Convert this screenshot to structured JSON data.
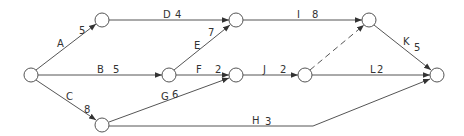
{
  "diagram": {
    "type": "activity-on-arrow network",
    "colors": {
      "line": "#444444",
      "node_fill": "#ffffff",
      "text": "#333333",
      "background": "#ffffff"
    },
    "nodes": [
      {
        "id": "n1",
        "x": 31,
        "y": 75
      },
      {
        "id": "n2",
        "x": 102,
        "y": 20
      },
      {
        "id": "n3",
        "x": 236,
        "y": 20
      },
      {
        "id": "n4",
        "x": 169,
        "y": 75
      },
      {
        "id": "n5",
        "x": 236,
        "y": 75
      },
      {
        "id": "n6",
        "x": 305,
        "y": 75
      },
      {
        "id": "n7",
        "x": 102,
        "y": 125
      },
      {
        "id": "n8",
        "x": 369,
        "y": 20
      },
      {
        "id": "n9",
        "x": 437,
        "y": 75
      }
    ],
    "activities": [
      {
        "name": "A",
        "duration": "5",
        "from": "n1",
        "to": "n2"
      },
      {
        "name": "B",
        "duration": "5",
        "from": "n1",
        "to": "n4"
      },
      {
        "name": "C",
        "duration": "8",
        "from": "n1",
        "to": "n7"
      },
      {
        "name": "D",
        "duration": "4",
        "from": "n2",
        "to": "n3"
      },
      {
        "name": "E",
        "duration": "7",
        "from": "n4",
        "to": "n3"
      },
      {
        "name": "F",
        "duration": "2",
        "from": "n4",
        "to": "n5"
      },
      {
        "name": "G",
        "duration": "6",
        "from": "n7",
        "to": "n5"
      },
      {
        "name": "H",
        "duration": "3",
        "from": "n7",
        "to": "n9"
      },
      {
        "name": "I",
        "duration": "8",
        "from": "n3",
        "to": "n8"
      },
      {
        "name": "J",
        "duration": "2",
        "from": "n5",
        "to": "n6"
      },
      {
        "name": "K",
        "duration": "5",
        "from": "n8",
        "to": "n9"
      },
      {
        "name": "L",
        "duration": "2",
        "from": "n6",
        "to": "n9"
      }
    ],
    "dummies": [
      {
        "from": "n6",
        "to": "n8",
        "style": "dashed"
      }
    ],
    "labels": {
      "A": "A",
      "A_dur": "5",
      "B": "B",
      "B_dur": "5",
      "C": "C",
      "C_dur": "8",
      "D": "D",
      "D_dur": "4",
      "E": "E",
      "E_dur": "7",
      "F": "F",
      "F_dur": "2",
      "G": "G",
      "G_dur": "6",
      "H": "H",
      "H_dur": "3",
      "I": "I",
      "I_dur": "8",
      "J": "J",
      "J_dur": "2",
      "K": "K",
      "K_dur": "5",
      "L": "L",
      "L_dur": "2"
    }
  }
}
